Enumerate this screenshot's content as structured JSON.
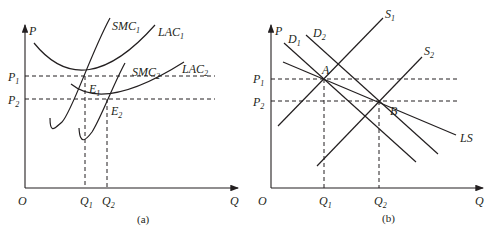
{
  "panels": [
    {
      "caption": "(a)",
      "origin": "O",
      "x_axis": "Q",
      "y_axis": "P",
      "price_levels": [
        {
          "label": "P",
          "sub": "1"
        },
        {
          "label": "P",
          "sub": "2"
        }
      ],
      "quantity_levels": [
        {
          "label": "Q",
          "sub": "1"
        },
        {
          "label": "Q",
          "sub": "2"
        }
      ],
      "curves": [
        {
          "label": "SMC",
          "sub": "1"
        },
        {
          "label": "LAC",
          "sub": "1"
        },
        {
          "label": "SMC",
          "sub": "2"
        },
        {
          "label": "LAC",
          "sub": "2"
        }
      ],
      "points": [
        {
          "label": "E",
          "sub": "1"
        },
        {
          "label": "E",
          "sub": "2"
        }
      ]
    },
    {
      "caption": "(b)",
      "origin": "O",
      "x_axis": "Q",
      "y_axis": "P",
      "price_levels": [
        {
          "label": "P",
          "sub": "1"
        },
        {
          "label": "P",
          "sub": "2"
        }
      ],
      "quantity_levels": [
        {
          "label": "Q",
          "sub": "1"
        },
        {
          "label": "Q",
          "sub": "2"
        }
      ],
      "curves": [
        {
          "label": "D",
          "sub": "1"
        },
        {
          "label": "D",
          "sub": "2"
        },
        {
          "label": "S",
          "sub": "1"
        },
        {
          "label": "S",
          "sub": "2"
        },
        {
          "label": "LS",
          "sub": ""
        }
      ],
      "points": [
        {
          "label": "A",
          "sub": ""
        },
        {
          "label": "B",
          "sub": ""
        }
      ]
    }
  ]
}
